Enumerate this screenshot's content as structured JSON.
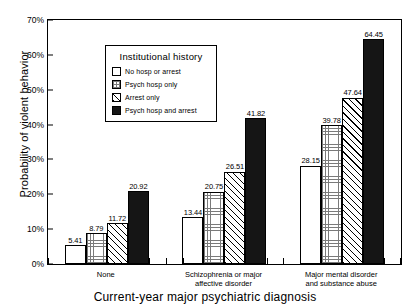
{
  "chart_data": {
    "type": "bar",
    "title": "",
    "xlabel": "Current-year major psychiatric diagnosis",
    "ylabel": "Probability of violent behavior",
    "ylim": [
      0,
      70
    ],
    "yticks": [
      "0%",
      "10%",
      "20%",
      "30%",
      "40%",
      "50%",
      "60%",
      "70%"
    ],
    "ytick_values": [
      0,
      10,
      20,
      30,
      40,
      50,
      60,
      70
    ],
    "grid": false,
    "legend_position": "upper-left-inside",
    "categories": [
      "None",
      "Schizophrenia or major\naffective disorder",
      "Major mental disorder\nand substance abuse"
    ],
    "series": [
      {
        "name": "No hosp or arrest",
        "pattern": "blank",
        "values": [
          5.41,
          13.44,
          28.15
        ],
        "labels": [
          "5.41",
          "13.44",
          "28.15"
        ]
      },
      {
        "name": "Psych hosp only",
        "pattern": "grid",
        "values": [
          8.79,
          20.75,
          39.78
        ],
        "labels": [
          "8.79",
          "20.75",
          "39.78"
        ]
      },
      {
        "name": "Arrest only",
        "pattern": "hatch",
        "values": [
          11.72,
          26.51,
          47.64
        ],
        "labels": [
          "11.72",
          "26.51",
          "47.64"
        ]
      },
      {
        "name": "Psych hosp and arrest",
        "pattern": "solid",
        "values": [
          20.92,
          41.82,
          64.45
        ],
        "labels": [
          "20.92",
          "41.82",
          "64.45"
        ]
      }
    ]
  },
  "legend": {
    "title": "Institutional history",
    "items": [
      {
        "label": "No hosp or arrest",
        "pattern": "blank"
      },
      {
        "label": "Psych hosp only",
        "pattern": "grid"
      },
      {
        "label": "Arrest only",
        "pattern": "hatch"
      },
      {
        "label": "Psych hosp and arrest",
        "pattern": "solid"
      }
    ]
  },
  "colors": {
    "axis": "#000000",
    "bar_solid": "#151515",
    "bar_blank": "#ffffff",
    "background": "#ffffff"
  }
}
